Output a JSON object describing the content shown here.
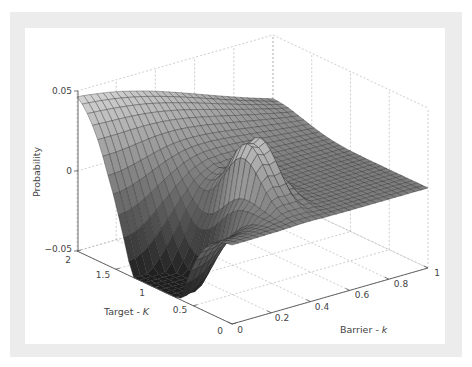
{
  "chart_data": {
    "type": "surface3d",
    "title": "",
    "xlabel": "Barrier - k",
    "ylabel": "Target - K",
    "zlabel": "Probability",
    "x_axis": {
      "name": "Barrier - k",
      "range": [
        0,
        1
      ],
      "ticks": [
        "0",
        "0.2",
        "0.4",
        "0.6",
        "0.8",
        "1"
      ]
    },
    "y_axis": {
      "name": "Target - K",
      "range": [
        0,
        2
      ],
      "ticks": [
        "0",
        "0.5",
        "1",
        "1.5",
        "2"
      ]
    },
    "z_axis": {
      "name": "Probability",
      "range": [
        -0.05,
        0.05
      ],
      "ticks": [
        "-0.05",
        "0",
        "0.05"
      ]
    },
    "grid": true,
    "colormap": "gray",
    "surface_description": "Broad ridge along K=2 edge (~0.025 to 0.04) descending to a deep trough near K=1, k=0 (~-0.05); a sharp oscillating peak near k≈0.35–0.45, K≈0.7 rising to ~0.03; flat plateau near 0 for larger k.",
    "samples": [
      {
        "k": 0.0,
        "K": 2.0,
        "z": 0.025
      },
      {
        "k": 0.3,
        "K": 2.0,
        "z": 0.04
      },
      {
        "k": 0.0,
        "K": 1.0,
        "z": -0.05
      },
      {
        "k": 0.4,
        "K": 0.7,
        "z": 0.03
      },
      {
        "k": 1.0,
        "K": 0.0,
        "z": 0.0
      },
      {
        "k": 1.0,
        "K": 2.0,
        "z": 0.0
      }
    ]
  },
  "axes": {
    "z_ticks": [
      "0.05",
      "0",
      "−0.05"
    ],
    "K_ticks": [
      "2",
      "1.5",
      "1",
      "0.5",
      "0"
    ],
    "k_ticks": [
      "0",
      "0.2",
      "0.4",
      "0.6",
      "0.8",
      "1"
    ],
    "z_label": "Probability",
    "K_label": "Target - ",
    "K_var": "K",
    "k_label": "Barrier - ",
    "k_var": "k"
  }
}
